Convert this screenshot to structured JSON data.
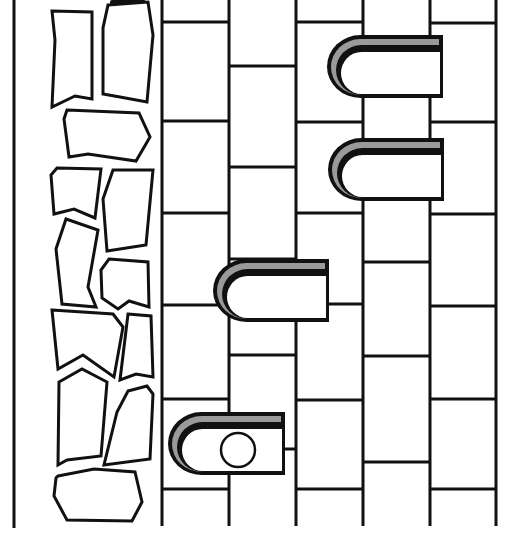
{
  "scene": {
    "title": "Climbing wall puzzle",
    "width": 523,
    "height": 545,
    "colors": {
      "background": "#ffffff",
      "outline": "#111111",
      "ledge_shade": "#9a9a9a"
    },
    "left_border_x": 14,
    "wall_top": 0,
    "wall_bottom": 526,
    "columns_x": [
      162,
      229,
      296,
      363,
      430,
      496
    ],
    "brick_joints": [
      {
        "col": 0,
        "ys": [
          22,
          121,
          213,
          305,
          399,
          489
        ]
      },
      {
        "col": 1,
        "ys": [
          66,
          167,
          259,
          355,
          449
        ]
      },
      {
        "col": 2,
        "ys": [
          22,
          122,
          213,
          304,
          400,
          489
        ]
      },
      {
        "col": 3,
        "ys": [
          62,
          167,
          262,
          356,
          462
        ]
      },
      {
        "col": 4,
        "ys": [
          23,
          122,
          214,
          306,
          399,
          489
        ]
      }
    ],
    "stones": [
      {
        "id": "stone-1",
        "points": "52,11 92,12 92,99 75,96 52,107 55,40"
      },
      {
        "id": "stone-2",
        "points": "108,5 148,2 153,35 147,102 120,97 103,94 103,28"
      },
      {
        "id": "stone-3",
        "points": "67,110 139,113 150,137 136,161 88,154 69,157 64,119"
      },
      {
        "id": "stone-4",
        "points": "57,168 101,169 95,218 74,209 54,214 51,175"
      },
      {
        "id": "stone-5",
        "points": "113,170 153,170 146,245 107,251 103,199"
      },
      {
        "id": "stone-6",
        "points": "66,219 98,230 88,287 96,307 62,304 56,249"
      },
      {
        "id": "stone-7",
        "points": "109,259 148,262 149,307 129,301 118,309 102,298 101,270"
      },
      {
        "id": "stone-8",
        "points": "52,310 113,314 123,327 114,377 83,355 58,369"
      },
      {
        "id": "stone-9",
        "points": "128,314 151,316 153,377 136,374 120,380"
      },
      {
        "id": "stone-10",
        "points": "59,382 82,369 107,382 101,456 67,460 58,465"
      },
      {
        "id": "stone-11",
        "points": "128,391 147,386 153,394 150,459 104,465 117,412"
      },
      {
        "id": "stone-12",
        "points": "58,476 94,469 135,472 142,502 132,521 67,520 54,496 56,478"
      }
    ],
    "ledges": [
      {
        "id": "ledge-top",
        "x": 327,
        "y": 35,
        "w": 116,
        "h": 63,
        "has_ball": false
      },
      {
        "id": "ledge-second",
        "x": 328,
        "y": 138,
        "w": 116,
        "h": 63,
        "has_ball": false
      },
      {
        "id": "ledge-middle",
        "x": 213,
        "y": 259,
        "w": 116,
        "h": 63,
        "has_ball": false
      },
      {
        "id": "ledge-bottom",
        "x": 168,
        "y": 412,
        "w": 117,
        "h": 63,
        "has_ball": true
      }
    ],
    "ball": {
      "cx": 238,
      "cy": 450,
      "r": 17
    },
    "top_shadow": {
      "x": 110,
      "y": 0,
      "w": 36,
      "h": 5
    }
  }
}
